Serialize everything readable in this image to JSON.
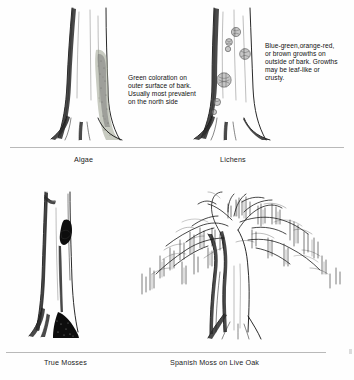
{
  "figure": {
    "background_color": "#fefefe",
    "ink_color": "#111111",
    "ground_line_color": "#b9b9b9"
  },
  "panels": [
    {
      "id": "algae",
      "caption": "Algae",
      "note_lines": [
        "Green coloration on",
        "outer surface of bark.",
        "Usually most prevalent",
        "on the north side"
      ],
      "organism_color": "#9aa08e",
      "organism_name": "algae-growth-patch"
    },
    {
      "id": "lichens",
      "caption": "Lichens",
      "note_lines": [
        "Blue-green,orange-red,",
        "or brown growths on",
        "outside of bark. Growths",
        "may be leaf-like or",
        "crusty."
      ],
      "organism_color": "#8d8d8d",
      "organism_name": "lichen-growth-rosettes"
    },
    {
      "id": "true-mosses",
      "caption": "True Mosses",
      "note_lines": [],
      "organism_color": "#0d0d0d",
      "organism_name": "moss-mat"
    },
    {
      "id": "spanish-moss",
      "caption": "Spanish Moss on Live Oak",
      "note_lines": [],
      "organism_color": "#111111",
      "organism_name": "spanish-moss-drapes"
    }
  ]
}
